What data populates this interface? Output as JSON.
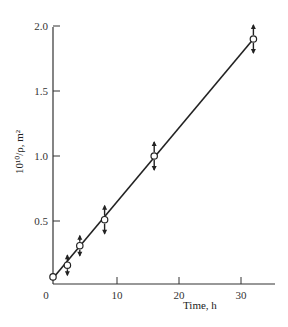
{
  "chart_data": {
    "type": "line",
    "title": "",
    "xlabel": "Time, h",
    "ylabel": "10¹⁰/ρ, m²",
    "xlim": [
      0,
      35
    ],
    "ylim": [
      0,
      2.0
    ],
    "x_ticks": [
      0,
      10,
      20,
      30
    ],
    "x_tick_labels": [
      "0",
      "10",
      "20",
      "30"
    ],
    "y_ticks": [
      0.5,
      1.0,
      1.5,
      2.0
    ],
    "y_tick_labels": [
      "0.5",
      "1.0",
      "1.5",
      "2.0"
    ],
    "grid": false,
    "legend": null,
    "series": [
      {
        "name": "measured",
        "marker": "open-circle",
        "error_indicators": "up/down arrows",
        "x": [
          0,
          2,
          4,
          8,
          16,
          32
        ],
        "y": [
          0.07,
          0.16,
          0.31,
          0.51,
          1.0,
          1.9
        ]
      },
      {
        "name": "linear fit",
        "style": "solid-line",
        "x": [
          0,
          32
        ],
        "y": [
          0.07,
          1.9
        ]
      }
    ]
  }
}
